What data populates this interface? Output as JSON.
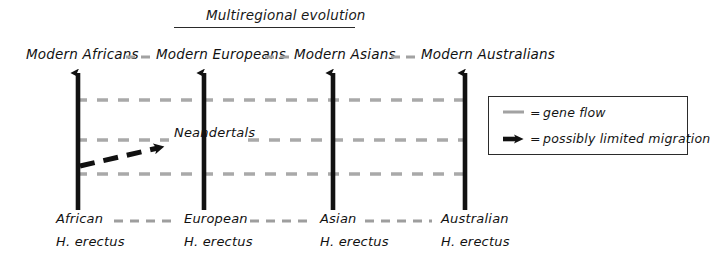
{
  "diagram": {
    "title": "Multiregional evolution",
    "type": "evolutionary-model-schematic"
  },
  "modern_populations": [
    {
      "label": "Modern Africans",
      "x": 78
    },
    {
      "label": "Modern Europeans",
      "x": 204
    },
    {
      "label": "Modern Asians",
      "x": 333
    },
    {
      "label": "Modern Australians",
      "x": 465
    }
  ],
  "ancestral_populations": [
    {
      "genus_line1": "African",
      "genus_line2": "H. erectus",
      "x": 78
    },
    {
      "genus_line1": "European",
      "genus_line2": "H. erectus",
      "x": 204
    },
    {
      "genus_line1": "Asian",
      "genus_line2": "H. erectus",
      "x": 333
    },
    {
      "genus_line1": "Australian",
      "genus_line2": "H. erectus",
      "x": 465
    }
  ],
  "annotations": {
    "neandertals": "Neandertals"
  },
  "legend": {
    "items": [
      {
        "symbol": "dashed-gray-line",
        "equals": "=",
        "label": "gene flow"
      },
      {
        "symbol": "thick-black-arrow",
        "equals": "=",
        "label": "possibly limited migration"
      }
    ]
  },
  "colors": {
    "ink": "#141414",
    "gene_flow": "#9a9a9a",
    "background": "#ffffff"
  }
}
